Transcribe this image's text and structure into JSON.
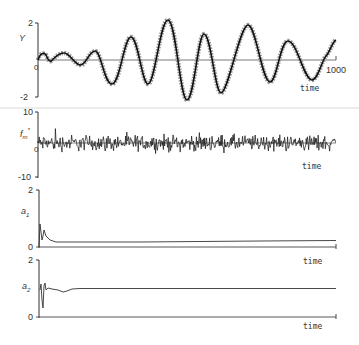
{
  "figure": {
    "caption": "",
    "ink_color": "#222222",
    "background": "#ffffff",
    "divider_color": "#e6e6e6"
  },
  "chart_data": [
    {
      "type": "line",
      "panel": 1,
      "title": "",
      "ylabel": "Y",
      "xlabel": "time",
      "x_tick_end_label": "1000",
      "ylim": [
        -2,
        2
      ],
      "y_ticks": [
        "2",
        "0",
        "-2"
      ],
      "xlim": [
        0,
        1000
      ],
      "grid": false,
      "legend": "none",
      "series": [
        {
          "name": "measured y (circles) and model output (line)",
          "marker": "circle",
          "x": [
            0,
            15,
            40,
            80,
            110,
            140,
            170,
            210,
            255,
            300,
            340,
            385,
            440,
            460,
            520,
            565,
            630,
            670,
            750,
            790,
            850,
            920,
            1000
          ],
          "values": [
            0.0,
            0.35,
            -0.1,
            0.35,
            -0.3,
            0.45,
            0.45,
            -1.2,
            1.25,
            -1.2,
            2.15,
            -2.15,
            1.4,
            1.4,
            -1.8,
            1.85,
            -1.2,
            1.0,
            -1.1,
            -0.4,
            -0.5,
            -1.1,
            1.1
          ]
        }
      ]
    },
    {
      "type": "line",
      "panel": 2,
      "title": "",
      "ylabel": "f_m*",
      "xlabel": "time",
      "ylim": [
        -10,
        10
      ],
      "y_ticks": [
        "10",
        "0",
        "-10"
      ],
      "xlim": [
        0,
        1000
      ],
      "grid": false,
      "legend": "none",
      "series": [
        {
          "name": "noise f_m*",
          "description": "zero-mean noise, amplitude mostly within about ±4, occasional spikes to about ±7",
          "mean": 0,
          "approx_amplitude": 4
        }
      ]
    },
    {
      "type": "line",
      "panel": 3,
      "title": "",
      "ylabel": "a1",
      "xlabel": "time",
      "ylim": [
        0,
        2
      ],
      "y_ticks": [
        "2",
        "0"
      ],
      "xlim": [
        0,
        1000
      ],
      "grid": false,
      "legend": "none",
      "series": [
        {
          "name": "a1 estimate",
          "x": [
            0,
            5,
            12,
            20,
            35,
            60,
            100,
            200,
            400,
            700,
            1000
          ],
          "values": [
            0.0,
            0.9,
            0.2,
            0.55,
            0.35,
            0.22,
            0.2,
            0.18,
            0.2,
            0.22,
            0.25
          ]
        }
      ]
    },
    {
      "type": "line",
      "panel": 4,
      "title": "",
      "ylabel": "a2",
      "xlabel": "time",
      "ylim": [
        0,
        2
      ],
      "y_ticks": [
        "2",
        "0"
      ],
      "xlim": [
        0,
        1000
      ],
      "grid": false,
      "legend": "none",
      "series": [
        {
          "name": "a2 estimate",
          "x": [
            0,
            4,
            8,
            12,
            16,
            22,
            30,
            50,
            90,
            130,
            200,
            400,
            700,
            1000
          ],
          "values": [
            1.0,
            1.1,
            0.3,
            1.15,
            0.8,
            1.2,
            1.0,
            1.0,
            0.85,
            1.0,
            1.0,
            1.0,
            1.0,
            1.0
          ]
        }
      ]
    }
  ],
  "panels": {
    "p1": {
      "ylabel": "Y",
      "top_tick": "2",
      "zero_tick": "0",
      "bottom_tick": "-2",
      "x_end_label": "1000",
      "xlabel": "time"
    },
    "p2": {
      "ylabel": "f",
      "ylabel_sub": "m",
      "ylabel_sup": "*",
      "top_tick": "10",
      "zero_tick": "0",
      "bottom_tick": "-10",
      "xlabel": "time"
    },
    "p3": {
      "ylabel": "a",
      "ylabel_sub": "1",
      "top_tick": "2",
      "zero_tick": "0",
      "xlabel": "time"
    },
    "p4": {
      "ylabel": "a",
      "ylabel_sub": "2",
      "top_tick": "2",
      "zero_tick": "0",
      "xlabel": "time"
    }
  }
}
